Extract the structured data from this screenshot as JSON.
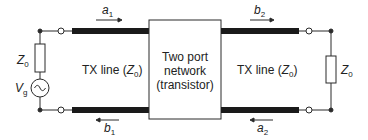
{
  "diagram": {
    "source": {
      "impedance_label": "Z",
      "impedance_sub": "0",
      "voltage_label": "V",
      "voltage_sub": "g"
    },
    "left_line": {
      "label": "TX line (",
      "label_z": "Z",
      "label_sub": "0",
      "label_close": ")",
      "wave_in": {
        "symbol": "a",
        "sub": "1",
        "direction": "right"
      },
      "wave_out": {
        "symbol": "b",
        "sub": "1",
        "direction": "left"
      }
    },
    "network": {
      "line1": "Two port",
      "line2": "network",
      "line3": "(transistor)"
    },
    "right_line": {
      "label": "TX line (",
      "label_z": "Z",
      "label_sub": "0",
      "label_close": ")",
      "wave_out": {
        "symbol": "b",
        "sub": "2",
        "direction": "right"
      },
      "wave_in": {
        "symbol": "a",
        "sub": "2",
        "direction": "left"
      }
    },
    "load": {
      "impedance_label": "Z",
      "impedance_sub": "0"
    },
    "colors": {
      "stroke": "#2a2a2a",
      "fill": "#ffffff"
    }
  }
}
